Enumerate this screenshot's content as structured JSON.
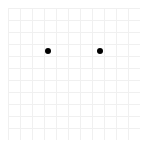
{
  "board": {
    "cols": 11,
    "rows": 11,
    "cell_size": 12,
    "origin": [
      8,
      8
    ],
    "line_color": "#f0f0f0",
    "background": "#ffffff"
  },
  "pieces": [
    {
      "x": 48,
      "y": 51,
      "color": "#000000",
      "icon": "black-dot"
    },
    {
      "x": 100,
      "y": 51,
      "color": "#000000",
      "icon": "black-dot"
    }
  ]
}
